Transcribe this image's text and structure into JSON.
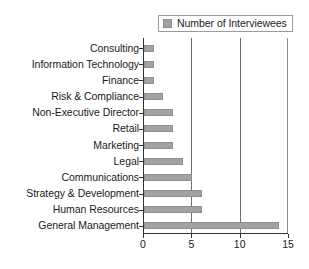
{
  "chart_data": {
    "type": "bar",
    "orientation": "horizontal",
    "title": "",
    "xlabel": "",
    "ylabel": "",
    "xlim": [
      0,
      15
    ],
    "xticks": [
      0,
      5,
      10,
      15
    ],
    "grid": "vertical",
    "legend": {
      "position": "top-right",
      "entries": [
        {
          "label": "Number of Interviewees",
          "color": "#a2a2a2"
        }
      ]
    },
    "categories": [
      "Consulting",
      "Information Technology",
      "Finance",
      "Risk & Compliance",
      "Non-Executive Director",
      "Retail",
      "Marketing",
      "Legal",
      "Communications",
      "Strategy & Development",
      "Human Resources",
      "General Management"
    ],
    "series": [
      {
        "name": "Number of Interviewees",
        "values": [
          1,
          1,
          1,
          2,
          3,
          3,
          3,
          4,
          5,
          6,
          6,
          14
        ]
      }
    ]
  },
  "colors": {
    "bar_fill": "#a2a2a2",
    "bar_stroke": "#8f8f8f",
    "axis": "#333333",
    "gridline": "#6e6e6e",
    "text": "#1a1a1a",
    "background": "#ffffff"
  }
}
